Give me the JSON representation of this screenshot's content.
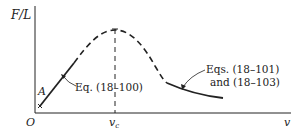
{
  "figure": {
    "y_axis_label": "F/L",
    "x_axis_label": "v",
    "origin_label": "O",
    "critical_label": "v",
    "critical_subscript": "c",
    "point_label": "A",
    "annotation_left": "Eq. (18–100)",
    "annotation_right_line1": "Eqs. (18–101)",
    "annotation_right_line2": "and (18–103)"
  },
  "colors": {
    "ink": "#222222",
    "background": "#ffffff"
  }
}
